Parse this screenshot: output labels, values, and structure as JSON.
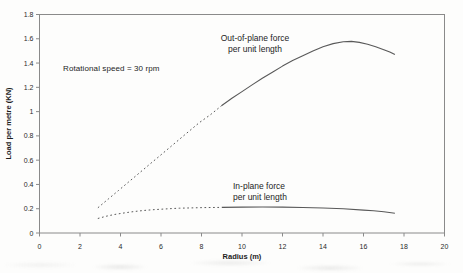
{
  "chart_data": {
    "type": "line",
    "title": "",
    "xlabel": "Radius (m)",
    "ylabel": "Load per metre (KN)",
    "annotation": "Rotational speed = 30 rpm",
    "xlim": [
      0,
      20
    ],
    "ylim": [
      0,
      1.8
    ],
    "xticks": [
      0,
      2,
      4,
      6,
      8,
      10,
      12,
      14,
      16,
      18,
      20
    ],
    "yticks": [
      0,
      0.2,
      0.4,
      0.6,
      0.8,
      1,
      1.2,
      1.4,
      1.6,
      1.8
    ],
    "ytick_labels": [
      "0",
      "0.2",
      "0.4",
      "0.6",
      "0.8",
      "1",
      "1.2",
      "1.4",
      "1.6",
      "1.8"
    ],
    "grid": false,
    "legend_position": "inline-labels",
    "line_color": "#595959",
    "frame_color": "#8a8a8a",
    "tick_text_color": "#2a2a2a",
    "series": [
      {
        "name": "Out-of-plane force per unit length",
        "label": "Out-of-plane force\nper unit length",
        "linestyle": "dotted for r<9 m, solid for r>9 m",
        "dotted_points": [
          [
            2.9,
            0.21
          ],
          [
            3.4,
            0.28
          ],
          [
            3.9,
            0.35
          ],
          [
            4.4,
            0.42
          ],
          [
            4.9,
            0.49
          ],
          [
            5.4,
            0.56
          ],
          [
            5.9,
            0.63
          ],
          [
            6.4,
            0.7
          ],
          [
            6.9,
            0.77
          ],
          [
            7.4,
            0.84
          ],
          [
            7.9,
            0.91
          ],
          [
            8.45,
            0.975
          ],
          [
            9.0,
            1.05
          ]
        ],
        "solid_points": [
          [
            9.0,
            1.05
          ],
          [
            9.5,
            1.11
          ],
          [
            10,
            1.165
          ],
          [
            10.5,
            1.22
          ],
          [
            11,
            1.275
          ],
          [
            11.5,
            1.325
          ],
          [
            12,
            1.375
          ],
          [
            12.5,
            1.42
          ],
          [
            13,
            1.46
          ],
          [
            13.5,
            1.5
          ],
          [
            14,
            1.535
          ],
          [
            14.5,
            1.56
          ],
          [
            15,
            1.575
          ],
          [
            15.4,
            1.578
          ],
          [
            15.8,
            1.57
          ],
          [
            16.2,
            1.555
          ],
          [
            16.6,
            1.535
          ],
          [
            17,
            1.51
          ],
          [
            17.3,
            1.49
          ],
          [
            17.55,
            1.47
          ]
        ]
      },
      {
        "name": "In-plane force per unit length",
        "label": "In-plane force\nper unit length",
        "linestyle": "dotted for r<9 m, solid for r>9 m",
        "dotted_points": [
          [
            2.9,
            0.12
          ],
          [
            3.3,
            0.138
          ],
          [
            3.7,
            0.152
          ],
          [
            4.1,
            0.163
          ],
          [
            4.5,
            0.173
          ],
          [
            4.9,
            0.181
          ],
          [
            5.3,
            0.188
          ],
          [
            5.7,
            0.193
          ],
          [
            6.1,
            0.197
          ],
          [
            6.5,
            0.201
          ],
          [
            6.9,
            0.204
          ],
          [
            7.3,
            0.206
          ],
          [
            7.7,
            0.208
          ],
          [
            8.1,
            0.209
          ],
          [
            8.5,
            0.21
          ],
          [
            9.0,
            0.211
          ]
        ],
        "solid_points": [
          [
            9.0,
            0.211
          ],
          [
            10,
            0.213
          ],
          [
            11,
            0.214
          ],
          [
            12,
            0.213
          ],
          [
            13,
            0.21
          ],
          [
            14,
            0.206
          ],
          [
            15,
            0.199
          ],
          [
            16,
            0.189
          ],
          [
            16.5,
            0.183
          ],
          [
            17,
            0.175
          ],
          [
            17.55,
            0.163
          ]
        ]
      }
    ]
  }
}
